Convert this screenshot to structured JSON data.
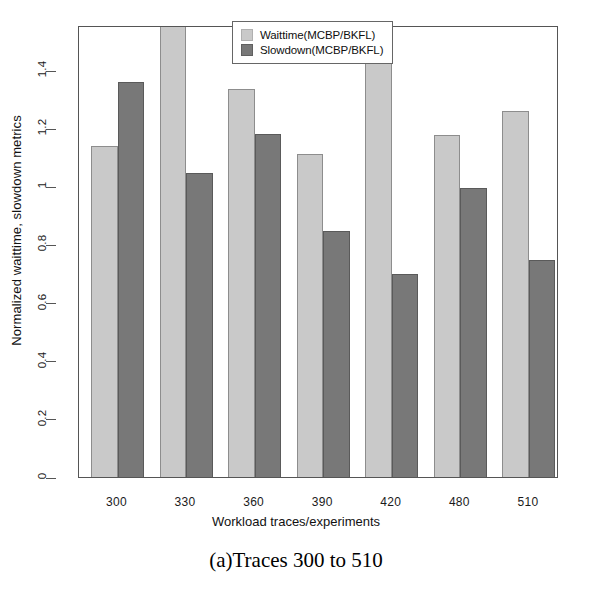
{
  "chart_data": {
    "type": "bar",
    "title": "",
    "xlabel": "Workload traces/experiments",
    "ylabel": "Normalized waittime, slowdown metrics",
    "categories": [
      "300",
      "330",
      "360",
      "390",
      "420",
      "480",
      "510"
    ],
    "series": [
      {
        "name": "Waittime(MCBP/BKFL)",
        "color": "#c9c9c9",
        "values": [
          1.14,
          1.56,
          1.335,
          1.11,
          1.55,
          1.175,
          1.26
        ]
      },
      {
        "name": "Slowdown(MCBP/BKFL)",
        "color": "#787878",
        "values": [
          1.36,
          1.045,
          1.18,
          0.845,
          0.7,
          0.995,
          0.745
        ]
      }
    ],
    "ylim": [
      0,
      1.555
    ],
    "yticks": [
      "0",
      "0.2",
      "0.4",
      "0.6",
      "0.8",
      "1",
      "1.2",
      "1.4"
    ],
    "ytick_values": [
      0,
      0.2,
      0.4,
      0.6,
      0.8,
      1.0,
      1.2,
      1.4
    ],
    "grid": false,
    "legend_position": "top-center"
  },
  "legend": {
    "entries": [
      {
        "label": "Waittime(MCBP/BKFL)"
      },
      {
        "label": "Slowdown(MCBP/BKFL)"
      }
    ]
  },
  "caption": {
    "text": "(a)Traces 300 to 510"
  }
}
